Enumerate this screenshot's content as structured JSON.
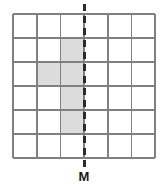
{
  "figure": {
    "type": "symmetry-grid-diagram",
    "background_color": "#ffffff"
  },
  "grid": {
    "rows": 6,
    "columns": 6,
    "origin_x": 13,
    "origin_y": 14,
    "cell_width": 23.7,
    "cell_height": 24.0,
    "line_color": "#808080",
    "line_width": 1.6,
    "border_color": "#808080",
    "border_width": 1.6,
    "cell_fill_empty": "#ffffff",
    "cell_fill_shaded": "#dcdcdc",
    "shaded_cells": [
      {
        "row": 1,
        "col": 2
      },
      {
        "row": 2,
        "col": 1
      },
      {
        "row": 2,
        "col": 2
      },
      {
        "row": 3,
        "col": 2
      },
      {
        "row": 4,
        "col": 2
      }
    ]
  },
  "mirror_line": {
    "label": "M",
    "orientation": "vertical",
    "x": 84,
    "y_start": 4,
    "y_end": 167,
    "color": "#2b2b2b",
    "width": 3,
    "dash": "7 5"
  },
  "label": {
    "text": "M",
    "x": 84,
    "y": 170,
    "color": "#1a1a1a",
    "font_size": 13
  }
}
